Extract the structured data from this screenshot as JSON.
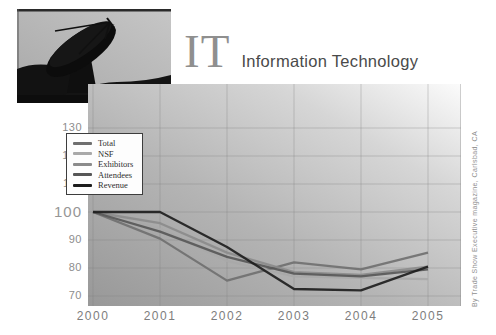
{
  "header": {
    "title_abbr": "IT",
    "title_full": "Information Technology"
  },
  "source_credit": "By Trade Show Executive magazine, Carlsbad, CA",
  "colors": {
    "title_abbr": "#8f8f8f",
    "subtitle": "#4a4a4a",
    "axis_text": "#8d8d8d",
    "grid_line": "#7e7e7e"
  },
  "chart_data": {
    "type": "line",
    "title": "IT Information Technology",
    "x_labels": [
      "2000",
      "2001",
      "2002",
      "2003",
      "2004",
      "2005"
    ],
    "y_ticks": [
      130,
      120,
      110,
      100,
      90,
      80,
      70
    ],
    "ylim": [
      70,
      130
    ],
    "grid": true,
    "legend_position": "top-left",
    "note": "values indexed to 100 in year 2000",
    "series": [
      {
        "name": "Total",
        "color": "#6f6f6f",
        "values": [
          100,
          90.5,
          75.5,
          82,
          79.5,
          85.5
        ]
      },
      {
        "name": "NSF",
        "color": "#a9a9a9",
        "values": [
          100,
          94,
          82.5,
          77,
          76.5,
          76
        ]
      },
      {
        "name": "Exhibitors",
        "color": "#8b8b8b",
        "values": [
          100,
          96,
          85.5,
          78.5,
          77.5,
          80.5
        ]
      },
      {
        "name": "Attendees",
        "color": "#565656",
        "values": [
          100,
          93,
          84,
          78,
          77,
          79.5
        ]
      },
      {
        "name": "Revenue",
        "color": "#1c1c1c",
        "values": [
          100,
          100,
          87.5,
          72.5,
          72,
          80.5
        ]
      }
    ]
  }
}
